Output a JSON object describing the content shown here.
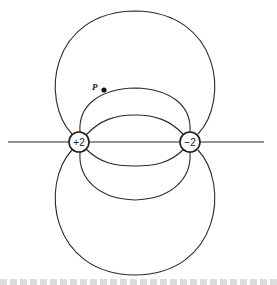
{
  "diagram": {
    "type": "electric-field-lines-dipole",
    "charges": [
      {
        "label": "+2",
        "cx": 79,
        "cy": 142
      },
      {
        "label": "−2",
        "cx": 190,
        "cy": 142
      }
    ],
    "point": {
      "label": "P",
      "cx": 104,
      "cy": 90
    },
    "colors": {
      "stroke": "#2a2a2a",
      "background": "#ffffff"
    }
  }
}
